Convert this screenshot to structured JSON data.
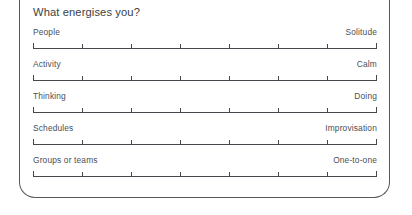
{
  "card": {
    "title": "What energises you?",
    "border_color": "#53585d",
    "background_color": "#ffffff",
    "text_color": "#3a3f44",
    "label_color": "#4a4f55",
    "scale_line_color": "#45494e"
  },
  "scales": {
    "tick_count": 8,
    "interval_count": 7,
    "rows": [
      {
        "left_label": "People",
        "right_label": "Solitude"
      },
      {
        "left_label": "Activity",
        "right_label": "Calm"
      },
      {
        "left_label": "Thinking",
        "right_label": "Doing"
      },
      {
        "left_label": "Schedules",
        "right_label": "Improvisation"
      },
      {
        "left_label": "Groups or teams",
        "right_label": "One-to-one"
      }
    ]
  }
}
